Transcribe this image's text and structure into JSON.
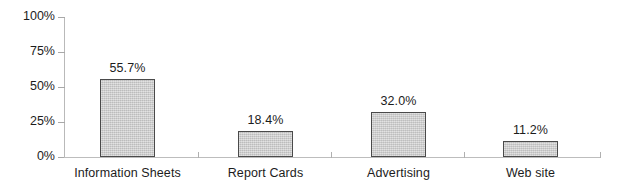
{
  "chart_data": {
    "type": "bar",
    "title": "",
    "subtitle": "",
    "xlabel": "",
    "ylabel": "",
    "categories": [
      "Information Sheets",
      "Report Cards",
      "Advertising",
      "Web site"
    ],
    "values": [
      55.7,
      18.4,
      32.0,
      11.2
    ],
    "value_labels": [
      "55.7%",
      "18.4%",
      "32.0%",
      "11.2%"
    ],
    "ylim": [
      0,
      100
    ],
    "ytick_values": [
      0,
      25,
      50,
      75,
      100
    ],
    "ytick_labels": [
      "0%",
      "25%",
      "50%",
      "75%",
      "100%"
    ],
    "grid": false,
    "legend": null,
    "legend_position": "none",
    "series": [
      {
        "name": "",
        "values": [
          55.7,
          18.4,
          32.0,
          11.2
        ]
      }
    ],
    "colors": {
      "bar_fill": "#c9c9c9",
      "bar_border": "#4a4a4a",
      "axis": "#b9b9b9",
      "text": "#1c1c1c",
      "background": "#ffffff"
    }
  }
}
